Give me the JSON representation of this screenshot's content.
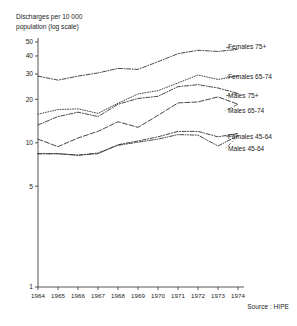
{
  "axis_title": "Discharges per 10 000\npopulation (log scale)",
  "source": "Source : HIPE",
  "chart_data": {
    "type": "line",
    "title": "Discharges per 10 000 population (log scale)",
    "xlabel": "",
    "ylabel": "Discharges per 10 000 population (log scale)",
    "yscale": "log",
    "ylim": [
      1,
      50
    ],
    "ytick_labels": [
      "50",
      "40",
      "30",
      "20",
      "10",
      "5",
      "1"
    ],
    "ytick_values": [
      50,
      40,
      30,
      20,
      10,
      5,
      1
    ],
    "grid": false,
    "legend": "inline-right-labels",
    "x": [
      1964,
      1965,
      1966,
      1967,
      1968,
      1969,
      1970,
      1971,
      1972,
      1973,
      1974
    ],
    "categories": [
      "1964",
      "1965",
      "1966",
      "1967",
      "1968",
      "1969",
      "1970",
      "1971",
      "1972",
      "1973",
      "1974"
    ],
    "series": [
      {
        "name": "Females 75+",
        "label": "Females 75+",
        "style": "dash-dot",
        "values": [
          29.0,
          27.2,
          29.0,
          30.5,
          32.8,
          32.3,
          36.5,
          41.5,
          43.8,
          43.0,
          44.5
        ]
      },
      {
        "name": "Females 65-74",
        "label": "Females 65-74",
        "style": "dotted",
        "values": [
          15.8,
          17.0,
          17.2,
          16.0,
          18.8,
          21.8,
          23.0,
          26.0,
          29.5,
          27.5,
          29.0
        ]
      },
      {
        "name": "Males 75+",
        "label": "Males 75+",
        "style": "dash-dot",
        "values": [
          13.3,
          15.2,
          16.3,
          15.2,
          18.5,
          20.3,
          21.0,
          24.5,
          25.3,
          24.0,
          22.0
        ]
      },
      {
        "name": "Males 65-74",
        "label": "Males 65-74",
        "style": "long-dash",
        "values": [
          10.6,
          9.4,
          10.8,
          12.0,
          14.0,
          12.8,
          15.5,
          18.9,
          19.2,
          20.8,
          18.5
        ]
      },
      {
        "name": "Females 45-64",
        "label": "Females 45-64",
        "style": "dash-dot",
        "values": [
          8.4,
          8.4,
          8.2,
          8.4,
          9.7,
          10.3,
          11.0,
          12.0,
          12.0,
          11.0,
          11.6
        ]
      },
      {
        "name": "Males 45-64",
        "label": "Males 45-64",
        "style": "dash-dot-dot",
        "values": [
          8.4,
          8.4,
          8.2,
          8.5,
          9.6,
          10.1,
          10.6,
          11.4,
          11.3,
          9.5,
          11.2
        ]
      }
    ],
    "series_label_positions": [
      {
        "name": "Females 75+",
        "x": 228,
        "y": 47
      },
      {
        "name": "Females 65-74",
        "x": 228,
        "y": 77
      },
      {
        "name": "Males 75+",
        "x": 228,
        "y": 96
      },
      {
        "name": "Males 65-74",
        "x": 228,
        "y": 111
      },
      {
        "name": "Females 45-64",
        "x": 228,
        "y": 137
      },
      {
        "name": "Males 45-64",
        "x": 228,
        "y": 149
      }
    ],
    "source": "Source : HIPE"
  }
}
